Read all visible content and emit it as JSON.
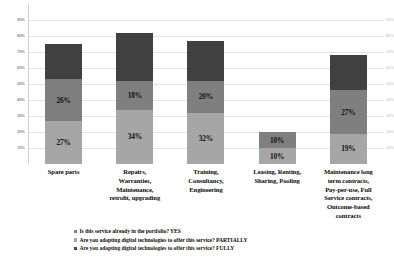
{
  "chart_data": {
    "type": "bar",
    "subtype": "stacked-column",
    "title": "",
    "xlabel": "",
    "ylabel": "",
    "ylim": [
      0,
      100
    ],
    "grid": true,
    "legend_position": "bottom-left",
    "categories": [
      "Spare parts",
      "Repairs, Warranties, Maintenance, retrofit, upgrading",
      "Training, Consultancy, Engineering",
      "Leasing, Renting, Sharing, Pooling",
      "Maintenance long term contracts, Pay-per-use, Full Service contracts, Outcome-based contracts"
    ],
    "category_lines": [
      [
        "Spare parts"
      ],
      [
        "Repairs,",
        "Warranties,",
        "Maintenance,",
        "retroﬁt, upgrading"
      ],
      [
        "Training,",
        "Consultancy,",
        "Engineering"
      ],
      [
        "Leasing, Renting,",
        "Sharing, Pooling"
      ],
      [
        "Maintenance long",
        "term contracts,",
        "Pay-per-use, Full",
        "Service contracts,",
        "Outcome-based",
        "contracts"
      ]
    ],
    "series": [
      {
        "name": "Is this service already in the portfolio? YES",
        "color": "#a6a6a6",
        "values": [
          27,
          34,
          32,
          10,
          19
        ],
        "labels": [
          "27%",
          "34%",
          "32%",
          "10%",
          "19%"
        ]
      },
      {
        "name": "Are you adopting digital technologies to offer this service? PARTIALLY",
        "color": "#7f7f7f",
        "values": [
          26,
          18,
          20,
          10,
          27
        ],
        "labels": [
          "26%",
          "18%",
          "20%",
          "10%",
          "27%"
        ]
      },
      {
        "name": "Are you adopting digital technologies to offer this service? FULLY",
        "color": "#404040",
        "values": [
          22,
          30,
          25,
          0,
          22
        ],
        "labels": [
          "",
          "",
          "",
          "",
          ""
        ]
      }
    ],
    "totals": [
      75,
      82,
      77,
      20,
      68
    ],
    "yticks": [
      "90%",
      "80%",
      "70%",
      "60%",
      "50%",
      "40%",
      "30%",
      "20%",
      "10%"
    ],
    "ytick_values": [
      90,
      80,
      70,
      60,
      50,
      40,
      30,
      20,
      10
    ]
  },
  "legend": {
    "items": [
      {
        "label": "Is this service already in the portfolio? YES",
        "color": "#7f7f7f"
      },
      {
        "label": "Are you adopting digital technologies to offer this service? PARTIALLY",
        "color": "#a6a6a6"
      },
      {
        "label": "Are you adopting digital technologies to offer this service? FULLY",
        "color": "#404040"
      }
    ]
  },
  "colors": {
    "segment_light": "#a6a6a6",
    "segment_medium": "#7f7f7f",
    "segment_dark": "#404040",
    "gridline": "#e3e3e5",
    "background": "#ffffff"
  }
}
